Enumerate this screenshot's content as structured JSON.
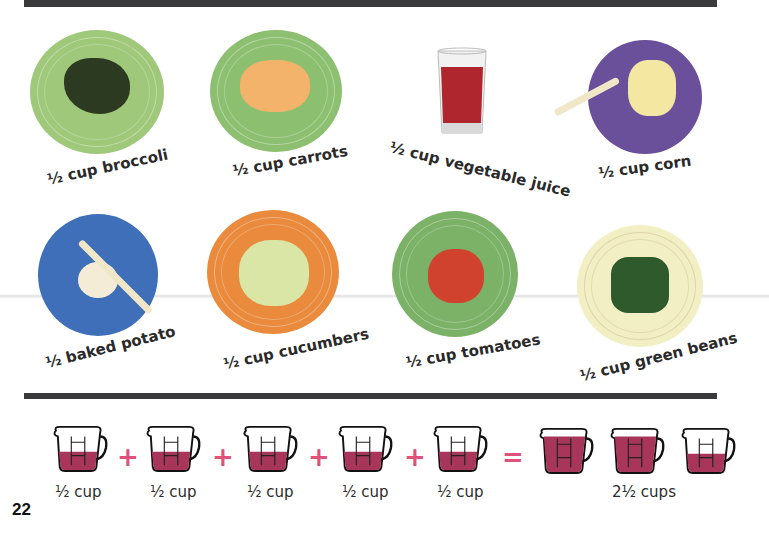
{
  "page": {
    "page_number": "22"
  },
  "foods": [
    {
      "id": "broccoli",
      "label": "½ cup broccoli",
      "plate_color": "#9fc87a",
      "food_color": "#2c3a22"
    },
    {
      "id": "carrots",
      "label": "½ cup carrots",
      "plate_color": "#8cc070",
      "food_color": "#f3b36a"
    },
    {
      "id": "vegetable-juice",
      "label": "½ cup vegetable juice",
      "liquid_color": "#b0262e"
    },
    {
      "id": "corn",
      "label": "½ cup corn",
      "plate_color": "#6a4f9a",
      "food_color": "#f3e7a2"
    },
    {
      "id": "baked-potato",
      "label": "½ baked potato",
      "plate_color": "#3f6fb8",
      "food_color": "#f4ecd6"
    },
    {
      "id": "cucumbers",
      "label": "½ cup cucumbers",
      "plate_color": "#e98a3c",
      "food_color": "#d9e6a6"
    },
    {
      "id": "tomatoes",
      "label": "½ cup tomatoes",
      "plate_color": "#7bb268",
      "food_color": "#d0412e"
    },
    {
      "id": "green-beans",
      "label": "½ cup green beans",
      "plate_color": "#f3efc4",
      "food_color": "#2f5a2c"
    }
  ],
  "equation": {
    "cups": [
      {
        "label": "½ cup",
        "fill": "half"
      },
      {
        "label": "½ cup",
        "fill": "half"
      },
      {
        "label": "½ cup",
        "fill": "half"
      },
      {
        "label": "½ cup",
        "fill": "half"
      },
      {
        "label": "½ cup",
        "fill": "half"
      }
    ],
    "plus_symbol": "+",
    "equals_symbol": "=",
    "result_cups": [
      {
        "fill": "full"
      },
      {
        "fill": "full"
      },
      {
        "fill": "half"
      }
    ],
    "result_label": "2½ cups",
    "liquid_color": "#a8365a",
    "operator_color": "#e0507a"
  }
}
